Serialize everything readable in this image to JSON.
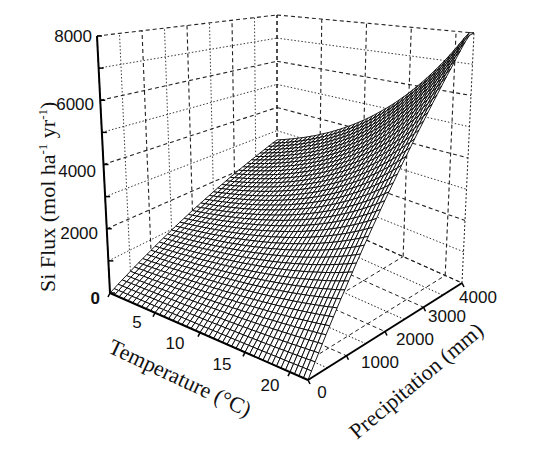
{
  "chart_data": {
    "type": "surface3d",
    "title": "",
    "xlabel": "Temperature (°C)",
    "ylabel": "Precipitation (mm)",
    "zlabel": "Si Flux (mol ha-1 yr-1)",
    "x_ticks": [
      5,
      10,
      15,
      20
    ],
    "y_ticks": [
      0,
      1000,
      2000,
      3000,
      4000
    ],
    "z_ticks": [
      0,
      2000,
      4000,
      6000,
      8000
    ],
    "xlim": [
      0,
      22
    ],
    "ylim": [
      0,
      4000
    ],
    "zlim": [
      0,
      8000
    ],
    "grid": true,
    "legend": null,
    "surface_samples": {
      "description": "Approximate Si flux read off the surface at corner/edge points",
      "points": [
        {
          "temperature": 0,
          "precipitation": 0,
          "si_flux": 0
        },
        {
          "temperature": 22,
          "precipitation": 0,
          "si_flux": 0
        },
        {
          "temperature": 0,
          "precipitation": 4000,
          "si_flux": 2600
        },
        {
          "temperature": 10,
          "precipitation": 4000,
          "si_flux": 4200
        },
        {
          "temperature": 15,
          "precipitation": 4000,
          "si_flux": 5600
        },
        {
          "temperature": 22,
          "precipitation": 4000,
          "si_flux": 8000
        },
        {
          "temperature": 22,
          "precipitation": 2000,
          "si_flux": 4000
        },
        {
          "temperature": 11,
          "precipitation": 2000,
          "si_flux": 1800
        }
      ]
    }
  },
  "axes": {
    "z_title_main": "Si Flux (mol ha",
    "z_title_sup1": "-1",
    "z_title_mid": " yr",
    "z_title_sup2": "-1",
    "z_title_end": ")",
    "x_title": "Temperature (°C)",
    "y_title": "Precipitation (mm)",
    "z_tick_labels": [
      "0",
      "2000",
      "4000",
      "6000",
      "8000"
    ],
    "x_tick_labels": [
      "5",
      "10",
      "15",
      "20"
    ],
    "y_tick_labels": [
      "0",
      "1000",
      "2000",
      "3000",
      "4000"
    ]
  },
  "colors": {
    "background": "#ffffff",
    "mesh": "#000000",
    "grid": "#222222"
  }
}
